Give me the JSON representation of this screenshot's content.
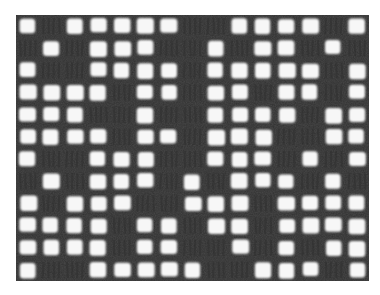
{
  "image": {
    "subject": "Filet crochet fabric swatch",
    "description": "Black-and-white photograph of a filet crochet mesh with open squares and filled blocks",
    "colors": {
      "background": "#ffffff",
      "thread": "#4a4a4a",
      "thread_dark": "#2f2f2f",
      "hole": "#f7f7f7"
    },
    "grid": {
      "columns": 15,
      "rows": 12,
      "legend": {
        "O": "open mesh",
        "X": "filled block"
      },
      "pattern": [
        "OXOOOOOXXOOOOXO",
        "XOXOOOXXOXOOXOX",
        "OXXOOOOXOOOOOXO",
        "OOOOXOOXOOXOOXO",
        "OOOXXOXXOOOOXOO",
        "OOOOXOOXOOOXXOO",
        "OXXOOOXXOOOXOXO",
        "XOXOOOXOXOOOXOX",
        "OXOOOXXOOOXOOOO",
        "OOOOXOOXOOXOOOO",
        "OOOOXOOXXOXOXOO",
        "OXXOOOOOXXOOOXO"
      ]
    }
  }
}
